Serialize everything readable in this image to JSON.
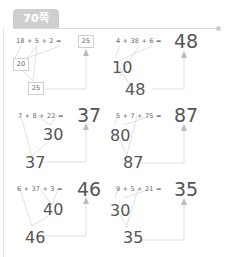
{
  "header": {
    "page_label": "70쪽"
  },
  "problems": [
    {
      "expr": "18  +  5  +  2  =",
      "answer": "25",
      "partial": "20",
      "final": "25"
    },
    {
      "expr": "4  +  38  +  6  =",
      "answer": "48",
      "partial": "10",
      "final": "48"
    },
    {
      "expr": "7  +  8  +  22  =",
      "answer": "37",
      "partial": "30",
      "final": "37"
    },
    {
      "expr": "5  +  7  +  75  =",
      "answer": "87",
      "partial": "80",
      "final": "87"
    },
    {
      "expr": "6  +  37  +  3  =",
      "answer": "46",
      "partial": "40",
      "final": "46"
    },
    {
      "expr": "9  +  5  +  21  =",
      "answer": "35",
      "partial": "30",
      "final": "35"
    }
  ]
}
